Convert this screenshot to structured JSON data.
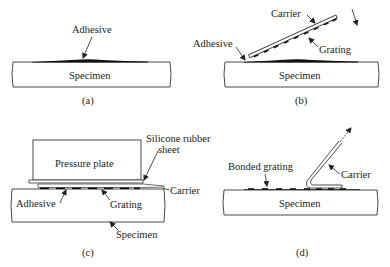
{
  "figure": {
    "panels": [
      {
        "id": "a",
        "caption": "(a)",
        "labels": {
          "adhesive": "Adhesive",
          "specimen": "Specimen"
        }
      },
      {
        "id": "b",
        "caption": "(b)",
        "labels": {
          "carrier": "Carrier",
          "grating": "Grating",
          "adhesive": "Adhesive",
          "specimen": "Specimen"
        }
      },
      {
        "id": "c",
        "caption": "(c)",
        "labels": {
          "pressure_plate": "Pressure plate",
          "silicone_line1": "Silicone rubber",
          "silicone_line2": "sheet",
          "carrier": "Carrier",
          "adhesive": "Adhesive",
          "grating": "Grating",
          "specimen": "Specimen"
        }
      },
      {
        "id": "d",
        "caption": "(d)",
        "labels": {
          "bonded_grating": "Bonded grating",
          "carrier": "Carrier",
          "specimen": "Specimen"
        }
      }
    ]
  }
}
